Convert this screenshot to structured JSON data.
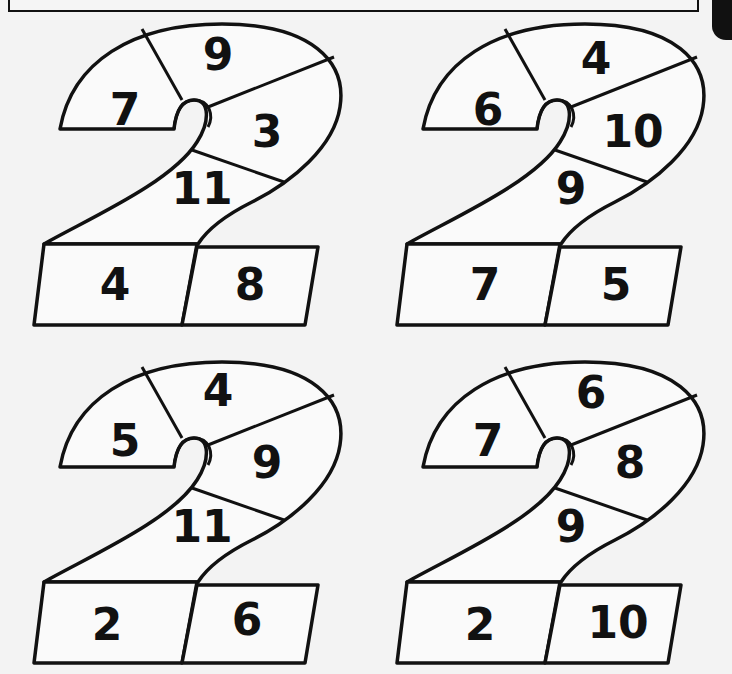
{
  "worksheet": {
    "title": "Number 2 puzzles",
    "figures": [
      {
        "id": "top-left",
        "regions": {
          "hook_left": "7",
          "top": "9",
          "right": "3",
          "middle": "11",
          "base_left": "4",
          "base_right": "8"
        }
      },
      {
        "id": "top-right",
        "regions": {
          "hook_left": "6",
          "top": "4",
          "right": "10",
          "middle": "9",
          "base_left": "7",
          "base_right": "5"
        }
      },
      {
        "id": "bottom-left",
        "regions": {
          "hook_left": "5",
          "top": "4",
          "right": "9",
          "middle": "11",
          "base_left": "2",
          "base_right": "6"
        }
      },
      {
        "id": "bottom-right",
        "regions": {
          "hook_left": "7",
          "top": "6",
          "right": "8",
          "middle": "9",
          "base_left": "2",
          "base_right": "10"
        }
      }
    ]
  },
  "colors": {
    "ink": "#111111",
    "paper": "#f3f3f3"
  }
}
